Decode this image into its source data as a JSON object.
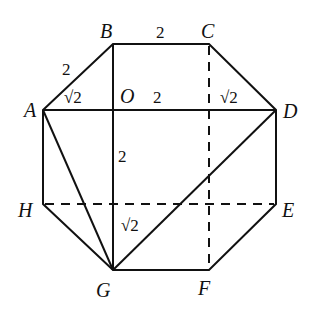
{
  "diagram": {
    "points": {
      "A": {
        "label": "A",
        "x": 43,
        "y": 110
      },
      "B": {
        "label": "B",
        "x": 113,
        "y": 44
      },
      "C": {
        "label": "C",
        "x": 209,
        "y": 44
      },
      "D": {
        "label": "D",
        "x": 276,
        "y": 110
      },
      "E": {
        "label": "E",
        "x": 276,
        "y": 204
      },
      "F": {
        "label": "F",
        "x": 209,
        "y": 270
      },
      "G": {
        "label": "G",
        "x": 113,
        "y": 270
      },
      "H": {
        "label": "H",
        "x": 43,
        "y": 204
      },
      "O": {
        "label": "O",
        "x": 113,
        "y": 110
      }
    },
    "measurements": {
      "AB": "2",
      "BC": "2",
      "AO": "√2",
      "OC_proj": "2",
      "CD_proj": "√2",
      "OG_segment": "2",
      "G_offset": "√2"
    },
    "solid_segments": [
      "AB",
      "BC",
      "CD",
      "DE",
      "EF",
      "FG",
      "GH",
      "HA",
      "AD",
      "BG",
      "AG",
      "DG"
    ],
    "dashed_segments": [
      "CF",
      "HE"
    ]
  }
}
